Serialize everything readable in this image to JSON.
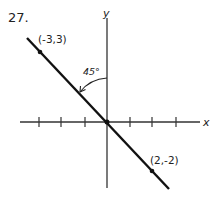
{
  "problem_number": "27.",
  "axes": {
    "x_label": "x",
    "y_label": "y"
  },
  "points": [
    {
      "label": "(-3,3)",
      "x": -3,
      "y": 3
    },
    {
      "label": "(2,-2)",
      "x": 2,
      "y": -2
    }
  ],
  "angle_label": "45°",
  "line": {
    "equation": "y = -x",
    "slope": -1
  },
  "ticks": {
    "x": [
      -3,
      -2,
      -1,
      1,
      2,
      3
    ]
  }
}
